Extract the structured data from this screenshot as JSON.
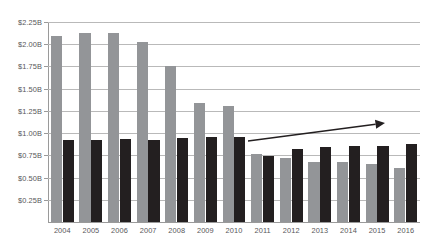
{
  "chart_data": {
    "type": "bar",
    "title": "",
    "subtitle": "",
    "xlabel": "",
    "ylabel": "",
    "grid": true,
    "legend": "none",
    "categories": [
      "2004",
      "2005",
      "2006",
      "2007",
      "2008",
      "2009",
      "2010",
      "2011",
      "2012",
      "2013",
      "2014",
      "2015",
      "2016"
    ],
    "ylim": [
      0,
      2.25
    ],
    "ytick_step": 0.25,
    "ytick_labels": [
      "$2.25B",
      "$2.00B",
      "$1.75B",
      "$1.50B",
      "$1.25B",
      "$1.00B",
      "$0.75B",
      "$0.50B",
      "$0.25B"
    ],
    "ytick_values": [
      2.25,
      2.0,
      1.75,
      1.5,
      1.25,
      1.0,
      0.75,
      0.5,
      0.25
    ],
    "value_unit": "B",
    "value_prefix": "$",
    "series": [
      {
        "name": "gray-series",
        "color": "#939598",
        "values": [
          2.09,
          2.13,
          2.13,
          2.02,
          1.76,
          1.34,
          1.31,
          0.77,
          0.72,
          0.68,
          0.68,
          0.65,
          0.61
        ]
      },
      {
        "name": "black-series",
        "color": "#231f20",
        "values": [
          0.92,
          0.92,
          0.93,
          0.92,
          0.95,
          0.96,
          0.96,
          0.74,
          0.82,
          0.84,
          0.85,
          0.86,
          0.88
        ]
      }
    ],
    "annotations": [
      {
        "type": "arrow",
        "name": "upward-trend-arrow",
        "label": "",
        "color": "#231f20",
        "from": {
          "x": 248,
          "y": 141
        },
        "to": {
          "x": 385,
          "y": 123
        }
      }
    ]
  },
  "colors": {
    "background": "#ffffff",
    "gridline": "#b9b9b9",
    "axis": "#9a9a9a",
    "tick_text": "#58585a",
    "series_gray": "#939598",
    "series_black": "#231f20",
    "arrow": "#231f20"
  }
}
